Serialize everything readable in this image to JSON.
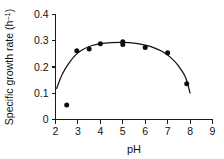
{
  "chart_data": {
    "type": "scatter",
    "title": "",
    "subtitle": "",
    "xlabel": "pH",
    "ylabel": "Specific growth rate (h⁻¹)",
    "ylabel_main": "Specific growth rate (h",
    "ylabel_sup": "–1",
    "ylabel_close": ")",
    "xlim": [
      2,
      9
    ],
    "ylim": [
      0,
      0.4
    ],
    "xticks": [
      2,
      3,
      4,
      5,
      6,
      7,
      8,
      9
    ],
    "xtick_labels": [
      "2",
      "3",
      "4",
      "5",
      "6",
      "7",
      "8",
      "9"
    ],
    "yticks": [
      0,
      0.1,
      0.2,
      0.3,
      0.4
    ],
    "ytick_labels": [
      "0",
      "0.1",
      "0.2",
      "0.3",
      "0.4"
    ],
    "grid": false,
    "legend": false,
    "legend_position": "none",
    "marker": "filled-circle",
    "marker_color": "#0d0d0d",
    "curve_color": "#111111",
    "axis_color": "#1a1a1a",
    "background_color": "#ffffff",
    "points": [
      {
        "x": 2.5,
        "y": 0.055
      },
      {
        "x": 2.95,
        "y": 0.262
      },
      {
        "x": 3.5,
        "y": 0.269
      },
      {
        "x": 4.0,
        "y": 0.289
      },
      {
        "x": 5.0,
        "y": 0.286
      },
      {
        "x": 5.0,
        "y": 0.296
      },
      {
        "x": 6.0,
        "y": 0.274
      },
      {
        "x": 7.0,
        "y": 0.254
      },
      {
        "x": 7.85,
        "y": 0.136
      }
    ],
    "fitted_curve": [
      {
        "x": 2.05,
        "y": 0.118
      },
      {
        "x": 2.3,
        "y": 0.172
      },
      {
        "x": 2.6,
        "y": 0.215
      },
      {
        "x": 2.9,
        "y": 0.246
      },
      {
        "x": 3.2,
        "y": 0.266
      },
      {
        "x": 3.6,
        "y": 0.281
      },
      {
        "x": 4.0,
        "y": 0.289
      },
      {
        "x": 4.5,
        "y": 0.293
      },
      {
        "x": 5.0,
        "y": 0.294
      },
      {
        "x": 5.5,
        "y": 0.291
      },
      {
        "x": 6.0,
        "y": 0.283
      },
      {
        "x": 6.4,
        "y": 0.273
      },
      {
        "x": 6.8,
        "y": 0.257
      },
      {
        "x": 7.2,
        "y": 0.231
      },
      {
        "x": 7.5,
        "y": 0.202
      },
      {
        "x": 7.8,
        "y": 0.16
      },
      {
        "x": 8.0,
        "y": 0.101
      }
    ]
  }
}
